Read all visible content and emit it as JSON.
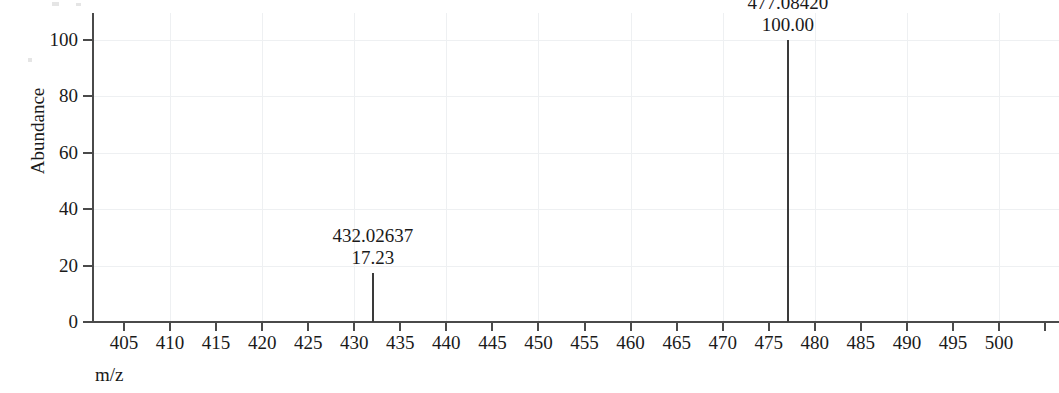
{
  "chart_data": {
    "type": "bar",
    "title": "",
    "subtitle": "",
    "xlabel": "m/z",
    "ylabel": "Abundance",
    "xlim": [
      402,
      505
    ],
    "ylim": [
      0,
      108
    ],
    "grid": true,
    "legend": null,
    "x_ticks": [
      405,
      410,
      415,
      420,
      425,
      430,
      435,
      440,
      445,
      450,
      455,
      460,
      465,
      470,
      475,
      480,
      485,
      490,
      495,
      500
    ],
    "x_tick_labels": [
      "405",
      "410",
      "415",
      "420",
      "425",
      "430",
      "435",
      "440",
      "445",
      "450",
      "455",
      "460",
      "465",
      "470",
      "475",
      "480",
      "485",
      "490",
      "495",
      "500"
    ],
    "y_ticks": [
      0,
      20,
      40,
      60,
      80,
      100
    ],
    "y_tick_labels": [
      "0",
      "20",
      "40",
      "60",
      "80",
      "100"
    ],
    "peaks": [
      {
        "mz": 432.02637,
        "intensity": 17.23,
        "mz_label": "432.02637",
        "intensity_label": "17.23"
      },
      {
        "mz": 477.0842,
        "intensity": 100.0,
        "mz_label": "477.08420",
        "intensity_label": "100.00"
      }
    ],
    "colors": {
      "axis": "#4a4a4a",
      "peak": "#3a3a3a",
      "grid": "#eef0f2",
      "text": "#1a1a1a",
      "background": "#ffffff"
    }
  }
}
